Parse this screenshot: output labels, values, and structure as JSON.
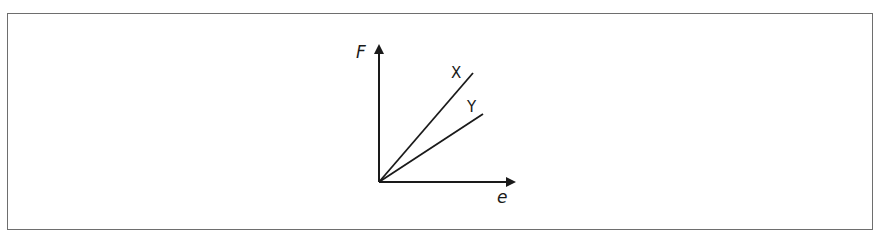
{
  "diagram": {
    "type": "force-extension graph",
    "y_axis_label": "F",
    "x_axis_label": "e",
    "lines": [
      {
        "label": "X",
        "description": "steeper line from origin"
      },
      {
        "label": "Y",
        "description": "less steep line from origin"
      }
    ]
  },
  "colors": {
    "ink": "#1a1a1a",
    "border": "#6e6e6e",
    "background": "#ffffff"
  }
}
